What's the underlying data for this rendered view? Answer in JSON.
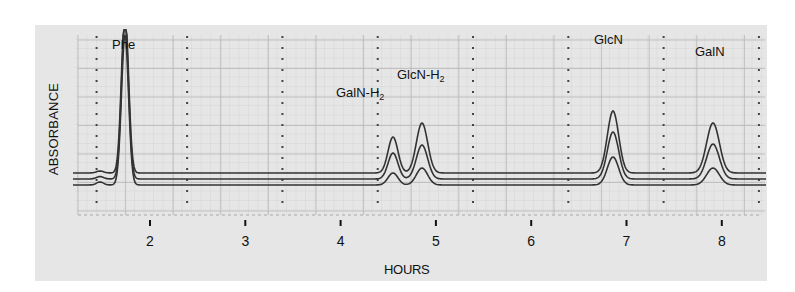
{
  "chart_data": {
    "type": "line",
    "title": "",
    "xlabel": "HOURS",
    "ylabel": "ABSORBANCE",
    "x_ticks": [
      2,
      3,
      4,
      5,
      6,
      7,
      8
    ],
    "xlim": [
      1.0,
      8.5
    ],
    "grid": true,
    "legend": null,
    "series": [
      {
        "name": "trace-top",
        "baseline_offset": 2,
        "peaks": [
          {
            "label": "Phe",
            "x": 1.75,
            "height": 1.0
          },
          {
            "label": "GalN-H2",
            "x": 4.55,
            "height": 0.36
          },
          {
            "label": "GlcN-H2",
            "x": 4.85,
            "height": 0.5
          },
          {
            "label": "GlcN",
            "x": 6.85,
            "height": 0.62
          },
          {
            "label": "GalN",
            "x": 7.9,
            "height": 0.5
          }
        ]
      },
      {
        "name": "trace-middle",
        "baseline_offset": 1,
        "peaks": [
          {
            "label": "Phe",
            "x": 1.75,
            "height": 1.0
          },
          {
            "label": "GalN-H2",
            "x": 4.55,
            "height": 0.26
          },
          {
            "label": "GlcN-H2",
            "x": 4.85,
            "height": 0.34
          },
          {
            "label": "GlcN",
            "x": 6.85,
            "height": 0.47
          },
          {
            "label": "GalN",
            "x": 7.9,
            "height": 0.35
          }
        ]
      },
      {
        "name": "trace-bottom",
        "baseline_offset": 0,
        "peaks": [
          {
            "label": "Phe",
            "x": 1.75,
            "height": 1.0
          },
          {
            "label": "GalN-H2",
            "x": 4.55,
            "height": 0.12
          },
          {
            "label": "GlcN-H2",
            "x": 4.85,
            "height": 0.17
          },
          {
            "label": "GlcN",
            "x": 6.85,
            "height": 0.28
          },
          {
            "label": "GalN",
            "x": 7.9,
            "height": 0.17
          }
        ]
      }
    ],
    "annotations": [
      "Phe",
      "GalN-H2",
      "GlcN-H2",
      "GlcN",
      "GalN"
    ]
  },
  "labels": {
    "ylabel": "ABSORBANCE",
    "xlabel": "HOURS",
    "ticks": [
      "2",
      "3",
      "4",
      "5",
      "6",
      "7",
      "8"
    ],
    "peaks": {
      "phe": "Phe",
      "galn_h2_base": "GalN-H",
      "galn_h2_sub": "2",
      "glcn_h2_base": "GlcN-H",
      "glcn_h2_sub": "2",
      "glcn": "GlcN",
      "galn": "GalN"
    }
  }
}
